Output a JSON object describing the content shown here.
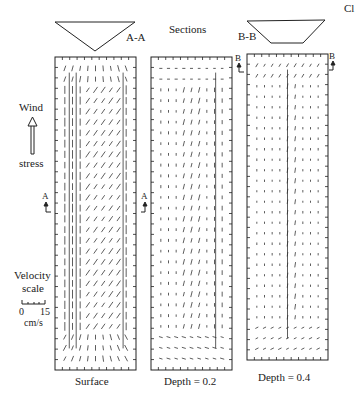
{
  "corner_label": "Cl",
  "title": "Sections",
  "sections": [
    {
      "id": "A-A",
      "label": "A-A",
      "shape": "triangle"
    },
    {
      "id": "B-B",
      "label": "B-B",
      "shape": "trapezoid"
    }
  ],
  "legend": {
    "wind_label_top": "Wind",
    "wind_label_bottom": "stress",
    "velocity_label_1": "Velocity",
    "velocity_label_2": "scale",
    "scale_min": "0",
    "scale_max": "15",
    "scale_units": "cm/s"
  },
  "section_markers": {
    "a_left": "A",
    "a_right": "A",
    "b_left": "B",
    "b_right": "B"
  },
  "panels": [
    {
      "id": "surface",
      "caption": "Surface",
      "x": 55,
      "y": 57,
      "w": 81,
      "h": 313,
      "ticks_x": 11,
      "ticks_y": 30,
      "field": "surface"
    },
    {
      "id": "depth02",
      "caption": "Depth = 0.2",
      "x": 151,
      "y": 57,
      "w": 81,
      "h": 313,
      "ticks_x": 11,
      "ticks_y": 30,
      "field": "depth02"
    },
    {
      "id": "depth04",
      "caption": "Depth = 0.4",
      "x": 247,
      "y": 54,
      "w": 81,
      "h": 306,
      "ticks_x": 11,
      "ticks_y": 30,
      "field": "depth04"
    }
  ],
  "colors": {
    "ink": "#222222",
    "vector": "#333333",
    "background": "#ffffff"
  }
}
